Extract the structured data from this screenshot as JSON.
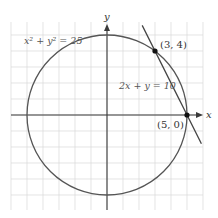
{
  "diagram": {
    "title": "",
    "axes": {
      "x_label": "x",
      "y_label": "y"
    },
    "grid": {
      "x_range": [
        -6,
        6
      ],
      "y_range": [
        -6,
        6
      ],
      "step": 1
    },
    "circle": {
      "equation_label": "x² + y² = 25",
      "center": [
        0,
        0
      ],
      "radius": 5
    },
    "line": {
      "equation_label": "2x + y = 10",
      "slope": -2,
      "intercept": 10
    },
    "points": [
      {
        "label": "(3, 4)",
        "x": 3,
        "y": 4
      },
      {
        "label": "(5, 0)",
        "x": 5,
        "y": 0
      }
    ],
    "colors": {
      "curve": "#555555",
      "axis": "#3a3a3a",
      "grid": "#d9d9d9",
      "point": "#111111"
    }
  }
}
